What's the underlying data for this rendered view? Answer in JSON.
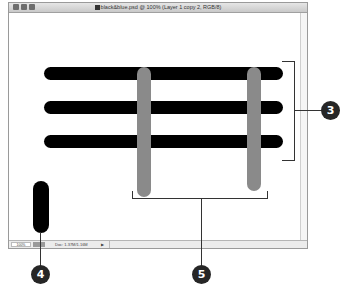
{
  "window": {
    "title": "black&blue.psd @ 100% (Layer 1 copy 2, RGB/8)",
    "controls": [
      "close-button",
      "minimize-button",
      "zoom-button"
    ]
  },
  "statusbar": {
    "zoom_level": "100%",
    "doc_info": "Doc: 1.37M/1.16M",
    "menu_arrow": "▶"
  },
  "canvas": {
    "black_bars_count": 3,
    "gray_bars_count": 2,
    "colors": {
      "black_bar": "#000000",
      "gray_bar": "#8a8a8a",
      "callout": "#262626"
    }
  },
  "callouts": [
    {
      "label": "3",
      "target": "black-horizontal-bars"
    },
    {
      "label": "4",
      "target": "black-pill-shape"
    },
    {
      "label": "5",
      "target": "gray-vertical-bars"
    }
  ]
}
